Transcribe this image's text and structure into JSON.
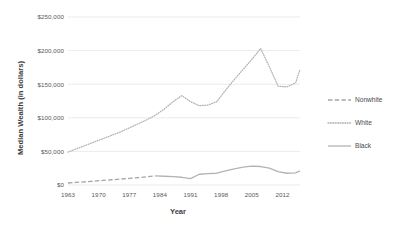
{
  "chart_data": {
    "type": "line",
    "title": "",
    "xlabel": "Year",
    "ylabel": "Median Wealth (in dollars)",
    "xlim": [
      1963,
      2016
    ],
    "ylim": [
      0,
      250000
    ],
    "xticks": [
      "1963",
      "1970",
      "1977",
      "1984",
      "1991",
      "1998",
      "2005",
      "2012"
    ],
    "xtick_values": [
      1963,
      1970,
      1977,
      1984,
      1991,
      1998,
      2005,
      2012
    ],
    "yticks": [
      "$0",
      "$50,000",
      "$100,000",
      "$150,000",
      "$200,000",
      "$250,000"
    ],
    "ytick_values": [
      0,
      50000,
      100000,
      150000,
      200000,
      250000
    ],
    "grid": "horizontal",
    "legend_position": "right",
    "series": [
      {
        "name": "Nonwhite",
        "style": "dashed",
        "color": "#a6a6a6",
        "x": [
          1963,
          1965,
          1967,
          1969,
          1971,
          1973,
          1975,
          1977,
          1979,
          1981,
          1983
        ],
        "values": [
          3000,
          3900,
          4800,
          5800,
          6800,
          7800,
          8800,
          9800,
          11000,
          12200,
          13500
        ]
      },
      {
        "name": "White",
        "style": "dotted",
        "color": "#b0b0b0",
        "x": [
          1963,
          1965,
          1967,
          1969,
          1971,
          1973,
          1975,
          1977,
          1979,
          1981,
          1983,
          1985,
          1987,
          1989,
          1991,
          1993,
          1995,
          1997,
          1999,
          2001,
          2003,
          2005,
          2007,
          2009,
          2011,
          2013,
          2015,
          2016
        ],
        "values": [
          49000,
          54000,
          59000,
          64000,
          69000,
          74000,
          79000,
          85000,
          91000,
          97000,
          104000,
          113000,
          124000,
          133000,
          124000,
          118000,
          119000,
          124000,
          141000,
          157000,
          172000,
          187000,
          203000,
          176000,
          147000,
          146000,
          152000,
          172000
        ]
      },
      {
        "name": "Black",
        "style": "solid",
        "color": "#b3b3b3",
        "x": [
          1983,
          1985,
          1987,
          1989,
          1991,
          1993,
          1995,
          1997,
          1999,
          2001,
          2003,
          2005,
          2007,
          2009,
          2011,
          2013,
          2015,
          2016
        ],
        "values": [
          13500,
          13000,
          12500,
          11500,
          9500,
          16000,
          17000,
          17500,
          21000,
          24000,
          26500,
          28000,
          27500,
          25000,
          20000,
          17500,
          18000,
          21000
        ]
      }
    ]
  },
  "axes": {
    "y_title": "Median Wealth (in dollars)",
    "x_title": "Year"
  },
  "legend": {
    "items": [
      {
        "label": "Nonwhite",
        "style": "dashed"
      },
      {
        "label": "White",
        "style": "dotted"
      },
      {
        "label": "Black",
        "style": "solid"
      }
    ]
  },
  "colors": {
    "grid": "#e2e2e2",
    "nonwhite": "#a6a6a6",
    "white_series": "#b0b0b0",
    "black_series": "#b3b3b3",
    "tick_text": "#595959",
    "title_text": "#3f3f3f"
  }
}
